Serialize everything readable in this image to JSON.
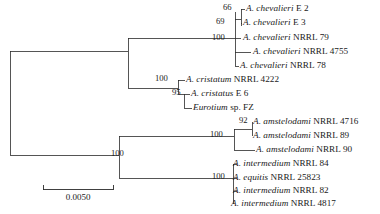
{
  "figure": {
    "type": "phylogenetic-tree",
    "width": 380,
    "height": 214,
    "background_color": "#ffffff",
    "line_color": "#2b2b2b"
  },
  "scale_bar": {
    "label": "0.0050",
    "x_start": 43,
    "x_end": 113,
    "y": 189
  },
  "taxa": [
    {
      "id": "chev_E2",
      "genus": "A. chevalieri",
      "strain": "E 2",
      "x": 246,
      "y": 9
    },
    {
      "id": "chev_E3",
      "genus": "A. chevalieri",
      "strain": "E 3",
      "x": 243,
      "y": 23
    },
    {
      "id": "chev_79",
      "genus": "A. chevalieri",
      "strain": "NRRL 79",
      "x": 243,
      "y": 38
    },
    {
      "id": "chev_4755",
      "genus": "A. chevalieri",
      "strain": "NRRL 4755",
      "x": 253,
      "y": 52
    },
    {
      "id": "chev_78",
      "genus": "A. chevalieri",
      "strain": "NRRL 78",
      "x": 240,
      "y": 66
    },
    {
      "id": "cris_4222",
      "genus": "A. cristatum",
      "strain": "NRRL 4222",
      "x": 186,
      "y": 80
    },
    {
      "id": "cris_E6",
      "genus": "A. cristatus",
      "strain": "E 6",
      "x": 191,
      "y": 94
    },
    {
      "id": "euro_FZ",
      "genus": "Eurotium",
      "strain": "sp. FZ",
      "x": 193,
      "y": 108
    },
    {
      "id": "amst_4716",
      "genus": "A. amstelodami",
      "strain": "NRRL 4716",
      "x": 253,
      "y": 122
    },
    {
      "id": "amst_89",
      "genus": "A. amstelodami",
      "strain": "NRRL 89",
      "x": 253,
      "y": 136
    },
    {
      "id": "amst_90",
      "genus": "A. amstelodami",
      "strain": "NRRL 90",
      "x": 256,
      "y": 150
    },
    {
      "id": "inte_84",
      "genus": "A. intermedium",
      "strain": "NRRL 84",
      "x": 233,
      "y": 164
    },
    {
      "id": "equi_25823",
      "genus": "A. equitis",
      "strain": "NRRL 25823",
      "x": 233,
      "y": 178
    },
    {
      "id": "inte_82",
      "genus": "A. intermedium",
      "strain": "NRRL 82",
      "x": 233,
      "y": 191
    },
    {
      "id": "inte_4817",
      "genus": "A. intermedium",
      "strain": "NRRL 4817",
      "x": 231,
      "y": 204
    }
  ],
  "support_values": [
    {
      "id": "node_chev_E2E3",
      "value": "66",
      "x": 223,
      "y": 8
    },
    {
      "id": "node_chev_inner",
      "value": "69",
      "x": 216,
      "y": 22
    },
    {
      "id": "node_chev_clade",
      "value": "100",
      "x": 212,
      "y": 38
    },
    {
      "id": "node_cris_clade",
      "value": "100",
      "x": 155,
      "y": 79
    },
    {
      "id": "node_cris_euro",
      "value": "95",
      "x": 172,
      "y": 93
    },
    {
      "id": "node_amst_inner",
      "value": "92",
      "x": 239,
      "y": 121
    },
    {
      "id": "node_amst_clade",
      "value": "100",
      "x": 210,
      "y": 135
    },
    {
      "id": "node_lower_root",
      "value": "100",
      "x": 111,
      "y": 154
    },
    {
      "id": "node_inte_clade",
      "value": "100",
      "x": 212,
      "y": 177
    }
  ],
  "branches": [
    {
      "id": "root-spine",
      "d": "M 10 51 L 10 155"
    },
    {
      "id": "root-to-upper",
      "d": "M 10 51 L 128 51"
    },
    {
      "id": "root-to-lower",
      "d": "M 10 155 L 119 155"
    },
    {
      "id": "upper-spine",
      "d": "M 128 51 L 128 88"
    },
    {
      "id": "upper-top-arm",
      "d": "M 128 38 L 128 38"
    },
    {
      "id": "upper-to-chev",
      "d": "M 128 38 L 235 38"
    },
    {
      "id": "upper-vert-chev",
      "d": "M 128 38 L 128 51"
    },
    {
      "id": "upper-to-cris",
      "d": "M 128 88 L 178 88"
    },
    {
      "id": "chev-spine",
      "d": "M 235 12 L 235 66"
    },
    {
      "id": "chev-E2E3-stem",
      "d": "M 235 19 L 241 19"
    },
    {
      "id": "chev-E2E3-spine",
      "d": "M 241 12 L 241 26"
    },
    {
      "id": "chev-E2-tip",
      "d": "M 241 9 L 245 9"
    },
    {
      "id": "chev-E2-vert",
      "d": "M 241 9 L 241 12"
    },
    {
      "id": "chev-E3-tip",
      "d": "M 241 23 L 242 23"
    },
    {
      "id": "chev-79-tip",
      "d": "M 235 38 L 241 38"
    },
    {
      "id": "chev-4755-tip",
      "d": "M 235 52 L 251 52"
    },
    {
      "id": "chev-78-tip",
      "d": "M 235 66 L 239 66"
    },
    {
      "id": "cris-spine",
      "d": "M 178 80 L 178 94"
    },
    {
      "id": "cris-4222-tip",
      "d": "M 178 80 L 185 80"
    },
    {
      "id": "cris-sub-stem",
      "d": "M 178 94 L 184 94"
    },
    {
      "id": "cris-sub-spine",
      "d": "M 184 94 L 184 108"
    },
    {
      "id": "cris-E6-tip",
      "d": "M 184 94 L 190 94"
    },
    {
      "id": "euro-tip",
      "d": "M 184 108 L 192 108"
    },
    {
      "id": "lower-spine",
      "d": "M 119 136 L 119 178"
    },
    {
      "id": "lower-to-amst",
      "d": "M 119 136 L 234 136"
    },
    {
      "id": "lower-to-inte",
      "d": "M 119 178 L 233 178"
    },
    {
      "id": "amst-spine",
      "d": "M 234 129 L 234 150"
    },
    {
      "id": "amst-inner-stem",
      "d": "M 234 129 L 252 129"
    },
    {
      "id": "amst-inner-spine",
      "d": "M 252 122 L 252 136"
    },
    {
      "id": "amst-4716-tip",
      "d": "M 252 122 L 252 122"
    },
    {
      "id": "amst-89-tip",
      "d": "M 252 136 L 252 136"
    },
    {
      "id": "amst-90-tip",
      "d": "M 234 150 L 255 150"
    },
    {
      "id": "inte-spine",
      "d": "M 233 164 L 233 204"
    },
    {
      "id": "inte-84-tip",
      "d": "M 233 164 L 237 164"
    },
    {
      "id": "equi-tip",
      "d": "M 233 178 L 237 178"
    },
    {
      "id": "inte-82-tip",
      "d": "M 233 191 L 237 191"
    },
    {
      "id": "inte-4817-tip",
      "d": "M 233 204 L 233 204"
    }
  ],
  "chart_data": {
    "type": "tree",
    "title": "",
    "leaf_count": 15,
    "scale_bar_value": 0.005,
    "tips": [
      "A. chevalieri E 2",
      "A. chevalieri E 3",
      "A. chevalieri NRRL 79",
      "A. chevalieri NRRL 4755",
      "A. chevalieri NRRL 78",
      "A. cristatum NRRL 4222",
      "A. cristatus E 6",
      "Eurotium sp. FZ",
      "A. amstelodami NRRL 4716",
      "A. amstelodami NRRL 89",
      "A. amstelodami NRRL 90",
      "A. intermedium NRRL 84",
      "A. equitis NRRL 25823",
      "A. intermedium NRRL 82",
      "A. intermedium NRRL 4817"
    ],
    "bootstrap_labels": [
      "66",
      "69",
      "100",
      "100",
      "95",
      "92",
      "100",
      "100",
      "100"
    ],
    "clades": [
      {
        "name": "chevalieri-clade",
        "support": "100",
        "members": [
          "A. chevalieri E 2",
          "A. chevalieri E 3",
          "A. chevalieri NRRL 79",
          "A. chevalieri NRRL 4755",
          "A. chevalieri NRRL 78"
        ]
      },
      {
        "name": "cristatum-clade",
        "support": "100",
        "members": [
          "A. cristatum NRRL 4222",
          "A. cristatus E 6",
          "Eurotium sp. FZ"
        ]
      },
      {
        "name": "amstelodami-clade",
        "support": "100",
        "members": [
          "A. amstelodami NRRL 4716",
          "A. amstelodami NRRL 89",
          "A. amstelodami NRRL 90"
        ]
      },
      {
        "name": "intermedium-clade",
        "support": "100",
        "members": [
          "A. intermedium NRRL 84",
          "A. equitis NRRL 25823",
          "A. intermedium NRRL 82",
          "A. intermedium NRRL 4817"
        ]
      }
    ]
  }
}
